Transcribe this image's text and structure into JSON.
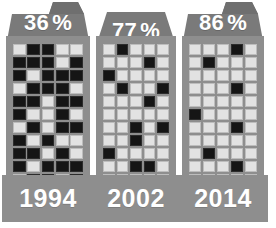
{
  "chart_data": {
    "type": "bar",
    "xlabel": "",
    "ylabel": "Percent",
    "categories": [
      "1994",
      "2002",
      "2014"
    ],
    "values": [
      36,
      77,
      86
    ],
    "value_suffix": "%",
    "ylim": [
      0,
      100
    ],
    "grid": false,
    "legend": null
  },
  "colors": {
    "background": "#ffffff",
    "building_body": "#8e8e8e",
    "roof": "#7a7a7a",
    "window_lit": "#e2e2e2",
    "window_dark": "#151515",
    "label_text": "#ffffff"
  },
  "buildings": [
    {
      "id": "building-1994",
      "percent_value": "36",
      "percent_symbol": "%",
      "year": "1994",
      "roof_style": "notched",
      "grid": {
        "rows": 11,
        "cols": 5,
        "cells": [
          [
            1,
            0,
            0,
            1,
            1
          ],
          [
            0,
            0,
            0,
            1,
            0
          ],
          [
            0,
            1,
            0,
            0,
            0
          ],
          [
            1,
            0,
            0,
            0,
            1
          ],
          [
            0,
            0,
            1,
            0,
            0
          ],
          [
            0,
            1,
            1,
            0,
            1
          ],
          [
            1,
            0,
            1,
            0,
            0
          ],
          [
            0,
            1,
            0,
            1,
            1
          ],
          [
            0,
            0,
            1,
            0,
            1
          ],
          [
            0,
            1,
            0,
            0,
            0
          ],
          [
            1,
            0,
            0,
            1,
            0
          ]
        ]
      }
    },
    {
      "id": "building-2002",
      "percent_value": "77",
      "percent_symbol": "%",
      "year": "2002",
      "roof_style": "plain",
      "grid": {
        "rows": 11,
        "cols": 5,
        "cells": [
          [
            1,
            0,
            1,
            1,
            1
          ],
          [
            1,
            1,
            1,
            0,
            1
          ],
          [
            0,
            1,
            1,
            1,
            1
          ],
          [
            1,
            0,
            1,
            1,
            0
          ],
          [
            1,
            1,
            1,
            0,
            1
          ],
          [
            1,
            1,
            1,
            1,
            1
          ],
          [
            1,
            1,
            0,
            1,
            0
          ],
          [
            1,
            1,
            0,
            1,
            1
          ],
          [
            0,
            1,
            1,
            1,
            1
          ],
          [
            1,
            1,
            0,
            0,
            1
          ],
          [
            1,
            1,
            1,
            1,
            1
          ]
        ]
      }
    },
    {
      "id": "building-2014",
      "percent_value": "86",
      "percent_symbol": "%",
      "year": "2014",
      "roof_style": "notched",
      "grid": {
        "rows": 11,
        "cols": 5,
        "cells": [
          [
            1,
            1,
            1,
            0,
            1
          ],
          [
            1,
            0,
            1,
            1,
            1
          ],
          [
            1,
            1,
            1,
            1,
            1
          ],
          [
            1,
            1,
            1,
            0,
            1
          ],
          [
            1,
            1,
            1,
            1,
            1
          ],
          [
            0,
            1,
            1,
            1,
            1
          ],
          [
            1,
            1,
            1,
            0,
            1
          ],
          [
            1,
            1,
            1,
            1,
            1
          ],
          [
            1,
            0,
            1,
            1,
            1
          ],
          [
            1,
            1,
            1,
            0,
            1
          ],
          [
            1,
            1,
            1,
            1,
            1
          ]
        ]
      }
    }
  ]
}
